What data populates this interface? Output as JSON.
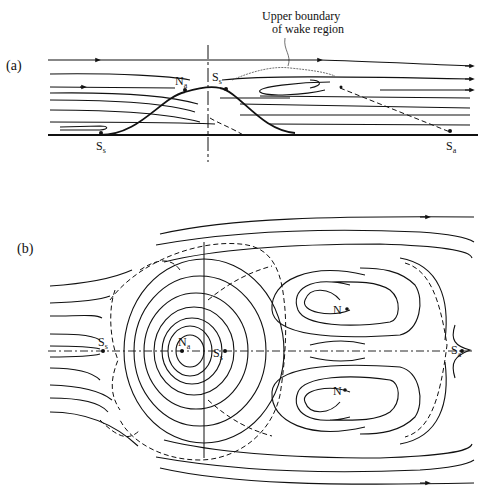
{
  "figure": {
    "panel_a": {
      "label": "(a)",
      "annotation": "Upper boundary",
      "annotation_line2": "of wake region",
      "points": {
        "na": {
          "main": "N",
          "sub": "a"
        },
        "ss_top": {
          "main": "S",
          "sub": "s"
        },
        "ss_left": {
          "main": "S",
          "sub": "s"
        },
        "sa_right": {
          "main": "S",
          "sub": "a"
        }
      }
    },
    "panel_b": {
      "label": "(b)",
      "points": {
        "ss_left": {
          "main": "S",
          "sub": "s"
        },
        "na": {
          "main": "N",
          "sub": "a"
        },
        "ss_center": {
          "main": "S",
          "sub": "s"
        },
        "sa_right": {
          "main": "S",
          "sub": "a"
        },
        "n_upper": {
          "main": "N"
        },
        "n_lower": {
          "main": "N"
        }
      }
    },
    "colors": {
      "ink": "#111111",
      "background": "#ffffff"
    }
  }
}
